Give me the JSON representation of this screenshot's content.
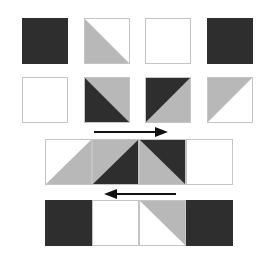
{
  "colors": {
    "dark": "#2e2e2e",
    "grey": "#b8b8b8",
    "white": "#ffffff",
    "border": "#c4c4c4",
    "arrow": "#111111"
  },
  "diagram": {
    "units": {
      "row1": [
        "solid-dark",
        "hst-grey-bottomleft-white-topright",
        "solid-white",
        "solid-dark"
      ],
      "row2": [
        "solid-white",
        "hst-dark-bottomleft-grey-topright",
        "hst-dark-topleft-grey-bottomright",
        "hst-grey-topleft-white-bottomright"
      ]
    },
    "assembled_rows": {
      "row3": [
        "hst-white-topleft-grey-bottomright",
        "hst-grey-topleft-dark-bottomright",
        "hst-grey-bottomleft-dark-topright",
        "solid-white"
      ],
      "row4": [
        "solid-dark",
        "solid-white",
        "hst-white-bottomleft-grey-topright",
        "solid-dark"
      ]
    },
    "arrows": [
      {
        "direction": "right",
        "label": "press-direction-right"
      },
      {
        "direction": "left",
        "label": "press-direction-left"
      }
    ]
  }
}
